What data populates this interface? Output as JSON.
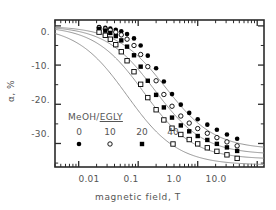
{
  "chart_data": {
    "type": "scatter",
    "title": "",
    "xlabel": "magnetic field, T",
    "ylabel": "α, %",
    "xscale": "log",
    "xlim": [
      0.004,
      13.0
    ],
    "ylim": [
      -36,
      1.5
    ],
    "xticks": [
      0.01,
      0.1,
      1.0,
      10.0
    ],
    "xticklabels": [
      "0.01",
      "0.1",
      "1.0",
      "10.0"
    ],
    "yticks": [
      0,
      -10,
      -20,
      -30
    ],
    "yticklabels": [
      "0.",
      "-10.",
      "-20.",
      "-30."
    ],
    "minor_ticks": true,
    "grid": false,
    "legend_title": "MeOH/EGLY",
    "legend_title_parts": {
      "prefix": "MeOH/",
      "underlined": "EGLY"
    },
    "legend_position": "center-left-inside",
    "series": [
      {
        "name": "0",
        "marker": "filled-circle",
        "color": "#000000",
        "x": [
          0.022,
          0.028,
          0.034,
          0.042,
          0.052,
          0.065,
          0.085,
          0.11,
          0.145,
          0.2,
          0.27,
          0.37,
          0.52,
          0.72,
          1.0,
          1.45,
          2.1,
          3.1,
          4.6
        ],
        "y": [
          -0.3,
          -0.5,
          -0.7,
          -1.0,
          -1.4,
          -2.1,
          -3.2,
          -5.0,
          -7.6,
          -10.8,
          -14.2,
          -17.4,
          -20.1,
          -22.2,
          -23.8,
          -25.2,
          -26.5,
          -27.7,
          -28.8
        ]
      },
      {
        "name": "10",
        "marker": "open-circle",
        "color": "#000000",
        "x": [
          0.022,
          0.028,
          0.034,
          0.042,
          0.052,
          0.065,
          0.085,
          0.11,
          0.145,
          0.2,
          0.27,
          0.37,
          0.52,
          0.72,
          1.0,
          1.45,
          2.1,
          3.1,
          4.6
        ],
        "y": [
          -0.5,
          -0.8,
          -1.1,
          -1.6,
          -2.3,
          -3.4,
          -5.0,
          -7.3,
          -10.4,
          -14.0,
          -17.5,
          -20.5,
          -23.0,
          -24.8,
          -26.2,
          -27.4,
          -28.5,
          -29.6,
          -30.6
        ]
      },
      {
        "name": "20",
        "marker": "filled-square",
        "color": "#000000",
        "x": [
          0.022,
          0.028,
          0.034,
          0.042,
          0.052,
          0.065,
          0.085,
          0.11,
          0.145,
          0.2,
          0.27,
          0.37,
          0.52,
          0.72,
          1.0,
          1.45,
          2.1,
          3.1,
          4.6
        ],
        "y": [
          -0.8,
          -1.2,
          -1.8,
          -2.6,
          -3.7,
          -5.3,
          -7.5,
          -10.4,
          -14.0,
          -17.6,
          -20.8,
          -23.4,
          -25.4,
          -26.9,
          -28.1,
          -29.1,
          -30.1,
          -31.0,
          -31.9
        ]
      },
      {
        "name": "40",
        "marker": "open-square",
        "color": "#000000",
        "x": [
          0.022,
          0.028,
          0.034,
          0.042,
          0.052,
          0.065,
          0.085,
          0.11,
          0.145,
          0.2,
          0.27,
          0.37,
          0.52,
          0.72,
          1.0,
          1.45,
          2.1,
          3.1,
          4.6
        ],
        "y": [
          -1.6,
          -2.4,
          -3.4,
          -4.8,
          -6.6,
          -8.9,
          -11.7,
          -14.9,
          -18.3,
          -21.4,
          -24.0,
          -26.1,
          -27.7,
          -29.0,
          -30.1,
          -31.1,
          -32.0,
          -32.9,
          -33.8
        ]
      }
    ],
    "fit_curves": [
      {
        "name": "0",
        "b50": 0.29,
        "amp": -31.5,
        "n": 1.05
      },
      {
        "name": "10",
        "b50": 0.19,
        "amp": -32.8,
        "n": 1.05
      },
      {
        "name": "20",
        "b50": 0.125,
        "amp": -34.0,
        "n": 1.05
      },
      {
        "name": "40",
        "b50": 0.065,
        "amp": -35.5,
        "n": 1.02
      }
    ]
  },
  "legend": {
    "title_prefix": "MeOH/",
    "title_underlined": "EGLY",
    "entries": [
      {
        "label": "0",
        "marker": "filled-circle"
      },
      {
        "label": "10",
        "marker": "open-circle"
      },
      {
        "label": "20",
        "marker": "filled-square"
      },
      {
        "label": "40",
        "marker": "open-square"
      }
    ]
  },
  "axes": {
    "x_label": "magnetic field, T",
    "y_label": "α, %",
    "x_ticklabels": [
      "0.01",
      "0.1",
      "1.0",
      "10.0"
    ],
    "y_ticklabels": [
      "0.",
      "-10.",
      "-20.",
      "-30."
    ]
  },
  "colors": {
    "axis": "#2b2b2b",
    "text": "#555555",
    "marker": "#000000",
    "curve": "#8a8a8a"
  }
}
